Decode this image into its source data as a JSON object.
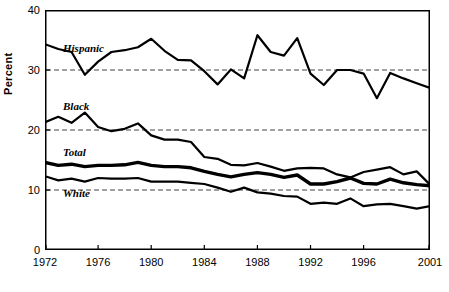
{
  "chart_data": {
    "type": "line",
    "title": "",
    "xlabel": "",
    "ylabel": "Percent",
    "xlim": [
      1972,
      2001
    ],
    "ylim": [
      0,
      40
    ],
    "yticks": [
      0,
      10,
      20,
      30,
      40
    ],
    "xticks": [
      1972,
      1976,
      1980,
      1984,
      1988,
      1992,
      1996,
      2001
    ],
    "grid": "horizontal dashed at 10, 20, 30",
    "legend_position": "inline labels at left of each series",
    "x": [
      1972,
      1973,
      1974,
      1975,
      1976,
      1977,
      1978,
      1979,
      1980,
      1981,
      1982,
      1983,
      1984,
      1985,
      1986,
      1987,
      1988,
      1989,
      1990,
      1991,
      1992,
      1993,
      1994,
      1995,
      1996,
      1997,
      1998,
      1999,
      2000,
      2001
    ],
    "series": [
      {
        "name": "Hispanic",
        "values": [
          34.3,
          33.5,
          33.0,
          29.2,
          31.4,
          33.0,
          33.3,
          33.8,
          35.2,
          33.2,
          31.7,
          31.6,
          29.8,
          27.6,
          30.1,
          28.6,
          35.8,
          33.0,
          32.4,
          35.3,
          29.4,
          27.5,
          30.0,
          30.0,
          29.4,
          25.3,
          29.5,
          28.6,
          27.8,
          27.0
        ]
      },
      {
        "name": "Black",
        "values": [
          21.3,
          22.2,
          21.2,
          22.9,
          20.5,
          19.8,
          20.2,
          21.1,
          19.1,
          18.4,
          18.4,
          18.0,
          15.5,
          15.2,
          14.2,
          14.1,
          14.5,
          13.9,
          13.2,
          13.6,
          13.7,
          13.6,
          12.6,
          12.1,
          13.0,
          13.4,
          13.8,
          12.6,
          13.1,
          10.9
        ]
      },
      {
        "name": "Total",
        "values": [
          14.6,
          14.1,
          14.3,
          13.9,
          14.1,
          14.1,
          14.2,
          14.6,
          14.1,
          13.9,
          13.9,
          13.7,
          13.1,
          12.6,
          12.2,
          12.6,
          12.9,
          12.6,
          12.1,
          12.5,
          11.0,
          11.0,
          11.4,
          12.0,
          11.1,
          11.0,
          11.8,
          11.2,
          10.9,
          10.7
        ]
      },
      {
        "name": "White",
        "values": [
          12.3,
          11.6,
          11.9,
          11.4,
          12.0,
          11.9,
          11.9,
          12.0,
          11.4,
          11.4,
          11.4,
          11.2,
          11.0,
          10.4,
          9.7,
          10.4,
          9.6,
          9.4,
          9.0,
          8.9,
          7.7,
          7.9,
          7.7,
          8.6,
          7.3,
          7.6,
          7.7,
          7.3,
          6.9,
          7.3
        ]
      }
    ]
  },
  "axis": {
    "ylabel": "Percent",
    "ytick_labels": [
      "0",
      "10",
      "20",
      "30",
      "40"
    ],
    "xtick_labels": [
      "1972",
      "1976",
      "1980",
      "1984",
      "1988",
      "1992",
      "1996",
      "2001"
    ]
  },
  "labels": {
    "hispanic": "Hispanic",
    "black": "Black",
    "total": "Total",
    "white": "White"
  },
  "colors": {
    "line": "#000000",
    "grid": "#444444",
    "background": "#ffffff"
  }
}
